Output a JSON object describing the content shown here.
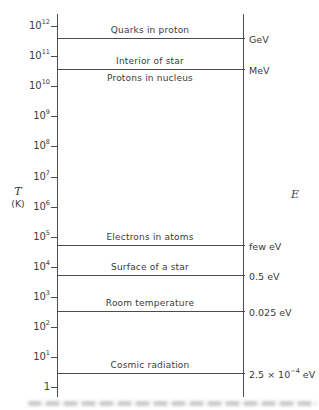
{
  "chart_data": {
    "type": "log-scale-comparison",
    "title": "",
    "left_axis": {
      "label": "T",
      "unit": "(K)",
      "scale": "log10",
      "range_exponents": [
        0,
        12
      ],
      "ticks": [
        {
          "text": "10",
          "exp": "12",
          "logv": 12
        },
        {
          "text": "10",
          "exp": "11",
          "logv": 11
        },
        {
          "text": "10",
          "exp": "10",
          "logv": 10
        },
        {
          "text": "10",
          "exp": "9",
          "logv": 9
        },
        {
          "text": "10",
          "exp": "8",
          "logv": 8
        },
        {
          "text": "10",
          "exp": "7",
          "logv": 7
        },
        {
          "text": "10",
          "exp": "6",
          "logv": 6
        },
        {
          "text": "10",
          "exp": "5",
          "logv": 5
        },
        {
          "text": "10",
          "exp": "4",
          "logv": 4
        },
        {
          "text": "10",
          "exp": "3",
          "logv": 3
        },
        {
          "text": "10",
          "exp": "2",
          "logv": 2
        },
        {
          "text": "10",
          "exp": "1",
          "logv": 1
        },
        {
          "text": "1",
          "exp": "",
          "logv": 0
        }
      ]
    },
    "right_axis": {
      "label": "E"
    },
    "lines": [
      {
        "logT": 11.6,
        "label_above": "Quarks in proton",
        "label_below": "",
        "energy": {
          "pre": "GeV",
          "exp": "",
          "post": ""
        }
      },
      {
        "logT": 10.57,
        "label_above": "Interior of star",
        "label_below": "Protons in nucleus",
        "energy": {
          "pre": "MeV",
          "exp": "",
          "post": ""
        }
      },
      {
        "logT": 4.74,
        "label_above": "Electrons in atoms",
        "label_below": "",
        "energy": {
          "pre": "few eV",
          "exp": "",
          "post": ""
        }
      },
      {
        "logT": 3.73,
        "label_above": "Surface of a star",
        "label_below": "",
        "energy": {
          "pre": "0.5 eV",
          "exp": "",
          "post": ""
        }
      },
      {
        "logT": 2.53,
        "label_above": "Room temperature",
        "label_below": "",
        "energy": {
          "pre": "0.025 eV",
          "exp": "",
          "post": ""
        }
      },
      {
        "logT": 0.47,
        "label_above": "Cosmic radiation",
        "label_below": "",
        "energy": {
          "pre": "2.5 × 10",
          "exp": "−4",
          "post": " eV"
        }
      }
    ],
    "layout": {
      "left_axis_x": 57,
      "right_axis_x": 243,
      "axis_top_y": 14,
      "axis_bottom_y": 397,
      "top_tick_y": 26,
      "px_per_decade": 30.1,
      "top_exponent": 12,
      "tick_len": 6,
      "tick_label_right": 50,
      "label_center_x": 150,
      "energy_label_x": 249,
      "line_overhang": 2
    }
  }
}
